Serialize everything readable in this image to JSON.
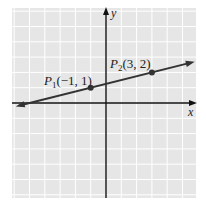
{
  "chart_data": {
    "type": "line",
    "title": "",
    "xlabel": "x",
    "ylabel": "y",
    "grid": true,
    "xlim": [
      -6,
      6
    ],
    "ylim": [
      -6,
      6.2
    ],
    "points": [
      {
        "name": "P1",
        "label_main": "P",
        "label_sub": "1",
        "label_coords": "(−1, 1)",
        "x": -1,
        "y": 1
      },
      {
        "name": "P2",
        "label_main": "P",
        "label_sub": "2",
        "label_coords": "(3, 2)",
        "x": 3,
        "y": 2
      }
    ],
    "line": {
      "slope": 0.25,
      "intercept": 1.25,
      "x_start": -5.9,
      "x_end": 5.8,
      "arrows": "both"
    }
  },
  "axes": {
    "x_label": "x",
    "y_label": "y"
  },
  "colors": {
    "background": "#e6e6e6",
    "grid": "#ffffff",
    "axis": "#111111",
    "line": "#333333",
    "point": "#333333"
  }
}
